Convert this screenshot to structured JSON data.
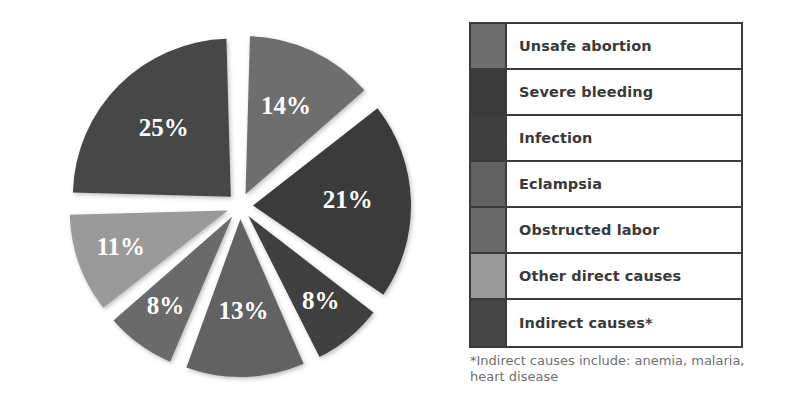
{
  "chart_data": {
    "type": "pie",
    "title": "",
    "subtitle": "",
    "xlabel": "",
    "ylabel": "",
    "legend_position": "right",
    "grid": false,
    "exploded": true,
    "unit": "%",
    "categories": [
      "Unsafe abortion",
      "Severe bleeding",
      "Infection",
      "Eclampsia",
      "Obstructed labor",
      "Other direct causes",
      "Indirect causes*"
    ],
    "values": [
      14,
      21,
      8,
      13,
      8,
      11,
      25
    ],
    "slice_labels": [
      "14%",
      "21%",
      "8%",
      "13%",
      "8%",
      "11%",
      "25%"
    ],
    "colors": [
      "#6e6e6e",
      "#3a3a3a",
      "#404040",
      "#626262",
      "#6a6a6a",
      "#9a9a9a",
      "#464646"
    ],
    "annotations": [
      "*Indirect causes include: anemia, malaria, heart disease"
    ]
  },
  "legend": {
    "rows": [
      {
        "label": "Unsafe abortion",
        "color": "#6e6e6e",
        "value": "14%"
      },
      {
        "label": "Severe bleeding",
        "color": "#3a3a3a",
        "value": "21%"
      },
      {
        "label": "Infection",
        "color": "#404040",
        "value": "8%"
      },
      {
        "label": "Eclampsia",
        "color": "#626262",
        "value": "13%"
      },
      {
        "label": "Obstructed labor",
        "color": "#6a6a6a",
        "value": "8%"
      },
      {
        "label": "Other direct causes",
        "color": "#9a9a9a",
        "value": "11%"
      },
      {
        "label": "Indirect causes*",
        "color": "#464646",
        "value": "25%"
      }
    ]
  },
  "footnote": {
    "text": "*Indirect causes include: anemia, malaria, heart disease"
  },
  "style": {
    "background": "#ffffff",
    "border_color": "#3b3b3b",
    "label_text_color": "#3a3a3a",
    "footnote_color": "#6f6f6f",
    "slice_label_color": "#ffffff"
  }
}
